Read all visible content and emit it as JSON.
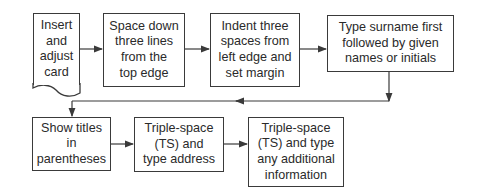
{
  "diagram": {
    "type": "flowchart",
    "steps": [
      {
        "id": "step-1",
        "label": "Insert\nand\nadjust\ncard",
        "shape": "document"
      },
      {
        "id": "step-2",
        "label": "Space down\nthree lines\nfrom the\ntop edge",
        "shape": "rectangle"
      },
      {
        "id": "step-3",
        "label": "Indent three\nspaces from\nleft edge and\nset margin",
        "shape": "rectangle"
      },
      {
        "id": "step-4",
        "label": "Type surname first\nfollowed by given\nnames or initials",
        "shape": "rectangle"
      },
      {
        "id": "step-5",
        "label": "Show titles\nin\nparentheses",
        "shape": "rectangle"
      },
      {
        "id": "step-6",
        "label": "Triple-space\n(TS) and\ntype address",
        "shape": "rectangle"
      },
      {
        "id": "step-7",
        "label": "Triple-space\n(TS) and type\nany additional\ninformation",
        "shape": "rectangle"
      }
    ],
    "edges": [
      {
        "from": "step-1",
        "to": "step-2"
      },
      {
        "from": "step-2",
        "to": "step-3"
      },
      {
        "from": "step-3",
        "to": "step-4"
      },
      {
        "from": "step-4",
        "to": "step-5"
      },
      {
        "from": "step-5",
        "to": "step-6"
      },
      {
        "from": "step-6",
        "to": "step-7"
      }
    ],
    "colors": {
      "line": "#3a3a3a",
      "text": "#2a2a2a",
      "background": "#ffffff"
    }
  }
}
